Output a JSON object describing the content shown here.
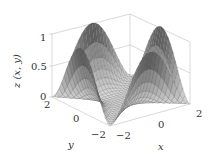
{
  "chart_data": {
    "type": "surface3d",
    "title": "",
    "xlabel": "x",
    "ylabel": "y",
    "zlabel": "z (x, y)",
    "xlim": [
      -2,
      2
    ],
    "ylim": [
      -2,
      2
    ],
    "zlim": [
      0,
      1
    ],
    "x_ticks": [
      "−2",
      "0",
      "2"
    ],
    "y_ticks": [
      "2",
      "0",
      "−2"
    ],
    "z_ticks": [
      "0",
      "0.5",
      "1"
    ],
    "grid": true,
    "colormap": "grayscale",
    "mesh_resolution": 24
  },
  "colors": {
    "background": "#ffffff",
    "axis_box": "#c8c8c8",
    "text": "#333333",
    "surface_dark": "#4a4a4a",
    "surface_light": "#d8d8d8",
    "mesh_line": "#3a3a3a"
  }
}
